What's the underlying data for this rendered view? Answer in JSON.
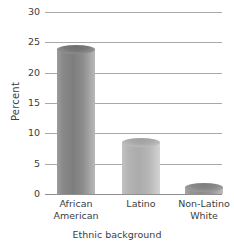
{
  "chart_data": {
    "type": "bar",
    "title": "",
    "categories": [
      "African\nAmerican",
      "Latino",
      "Non-Latino\nWhite"
    ],
    "values": [
      24.5,
      9.3,
      1.8
    ],
    "xlabel": "Ethnic background",
    "ylabel": "Percent",
    "ylim": [
      0,
      30
    ],
    "yticks": [
      0,
      5,
      10,
      15,
      20,
      25,
      30
    ],
    "ytick_labels": [
      "0",
      "5",
      "10",
      "15",
      "20",
      "25",
      "30"
    ],
    "grid": true,
    "legend": false,
    "bar_style": "3d-cylinder",
    "colors": {
      "bar_1": "#7d7d7d",
      "bar_2": "#b4b4b4",
      "bar_3": "#8b8b8b",
      "gridline": "#a9a9a9",
      "text": "#3d3d3d",
      "background": "#ffffff"
    }
  }
}
